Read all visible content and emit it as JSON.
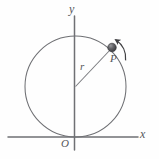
{
  "figure": {
    "type": "physics-diagram",
    "background_color": "#fefefe",
    "labels": {
      "y_axis": "y",
      "x_axis": "x",
      "origin": "O",
      "radius": "r",
      "particle": "P"
    },
    "colors": {
      "axis": "#6f7074",
      "circle": "#6f7074",
      "radius_line": "#7a7b7f",
      "particle_fill": "#4a4a4d",
      "arrow": "#3f3f42",
      "label_text": "#55565a"
    },
    "geometry": {
      "y_axis": {
        "x": 74.5,
        "y_top": 16,
        "y_bottom": 150
      },
      "x_axis": {
        "y": 137,
        "x_left": 8,
        "x_right": 138
      },
      "circle": {
        "cx": 75.5,
        "cy": 86.5,
        "r": 50.5
      },
      "radius_line": {
        "x1": 75.5,
        "y1": 86.5,
        "x2": 111.5,
        "y2": 48.5
      },
      "particle": {
        "cx": 112,
        "cy": 47.5,
        "r": 4.2
      },
      "motion_arrow": {
        "direction": "counterclockwise",
        "sweep_start_deg": 20,
        "sweep_end_deg": 62
      }
    }
  }
}
